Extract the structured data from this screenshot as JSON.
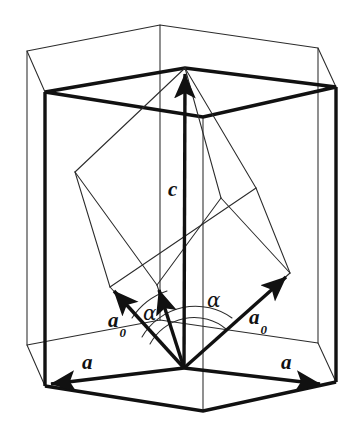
{
  "figure": {
    "background_color": "#ffffff",
    "line_color_thin": "#2b2b2b",
    "line_color_bold": "#111111",
    "thin_stroke_width": 1.0,
    "bold_stroke_width": 3.4
  },
  "labels": {
    "c_vector": "c",
    "a0_left": "a",
    "a0_left_sub": "0",
    "a0_right": "a",
    "a0_right_sub": "0",
    "a_left": "a",
    "a_right": "a",
    "alpha_left": "α",
    "alpha_right": "α"
  },
  "geometry": {
    "origin": {
      "x": 184,
      "y": 368
    },
    "c_tip": {
      "x": 185,
      "y": 68
    },
    "hexagon_top_thin": [
      {
        "x": 27,
        "y": 51
      },
      {
        "x": 160,
        "y": 25
      },
      {
        "x": 318,
        "y": 48
      },
      {
        "x": 336,
        "y": 87
      },
      {
        "x": 203,
        "y": 117
      },
      {
        "x": 45,
        "y": 92
      }
    ],
    "hexagon_top_bold": [
      {
        "x": 45,
        "y": 92
      },
      {
        "x": 185,
        "y": 68
      },
      {
        "x": 336,
        "y": 87
      },
      {
        "x": 336,
        "y": 87
      },
      {
        "x": 203,
        "y": 117
      },
      {
        "x": 45,
        "y": 92
      }
    ],
    "hexagon_bottom": [
      {
        "x": 27,
        "y": 345
      },
      {
        "x": 160,
        "y": 320
      },
      {
        "x": 318,
        "y": 343
      },
      {
        "x": 336,
        "y": 382
      },
      {
        "x": 203,
        "y": 411
      },
      {
        "x": 45,
        "y": 386
      }
    ],
    "a_left_tip": {
      "x": 45,
      "y": 385
    },
    "a_right_tip": {
      "x": 326,
      "y": 384
    },
    "a0_left_tip": {
      "x": 110,
      "y": 287
    },
    "a0_mid_tip": {
      "x": 157,
      "y": 285
    },
    "a0_right_tip": {
      "x": 290,
      "y": 273
    },
    "rhombohedron_vertices": [
      {
        "x": 184,
        "y": 368
      },
      {
        "x": 110,
        "y": 287
      },
      {
        "x": 290,
        "y": 273
      },
      {
        "x": 157,
        "y": 285
      },
      {
        "x": 75,
        "y": 172
      },
      {
        "x": 256,
        "y": 188
      },
      {
        "x": 221,
        "y": 198
      },
      {
        "x": 185,
        "y": 68
      }
    ],
    "alpha_arc_left": {
      "cx": 184,
      "cy": 368,
      "r": 78,
      "from_deg": 180,
      "to_deg": 228
    },
    "alpha_arc_right": {
      "cx": 184,
      "cy": 368,
      "r": 96,
      "from_deg": 0,
      "to_deg": 318
    }
  }
}
